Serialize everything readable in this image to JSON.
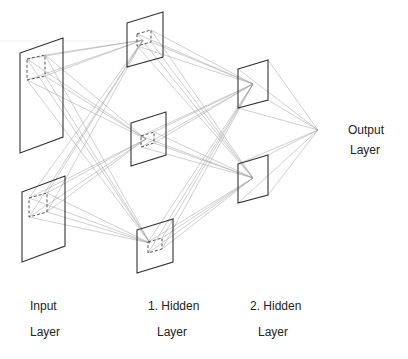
{
  "labels": {
    "input": {
      "line1": "Input",
      "line2": "Layer"
    },
    "hidden1": {
      "line1": "1. Hidden",
      "line2": "Layer"
    },
    "hidden2": {
      "line1": "2. Hidden",
      "line2": "Layer"
    },
    "output": {
      "line1": "Output",
      "line2": "Layer"
    }
  },
  "colors": {
    "plane_stroke": "#333333",
    "connection": "#9a9a9a",
    "text": "#222222",
    "background": "#ffffff"
  },
  "layers": {
    "input": [
      {
        "plane": [
          [
            20,
            53
          ],
          [
            63,
            38
          ],
          [
            63,
            137
          ],
          [
            20,
            153
          ]
        ],
        "field": [
          [
            27,
            59
          ],
          [
            45,
            55
          ],
          [
            45,
            76
          ],
          [
            27,
            80
          ]
        ]
      },
      {
        "plane": [
          [
            22,
            192
          ],
          [
            65,
            176
          ],
          [
            65,
            246
          ],
          [
            22,
            262
          ]
        ],
        "field": [
          [
            29,
            198
          ],
          [
            47,
            193
          ],
          [
            47,
            212
          ],
          [
            29,
            217
          ]
        ]
      }
    ],
    "hidden1": [
      {
        "plane": [
          [
            127,
            23
          ],
          [
            163,
            12
          ],
          [
            163,
            57
          ],
          [
            127,
            67
          ]
        ],
        "field": [
          [
            137,
            34
          ],
          [
            151,
            30
          ],
          [
            151,
            42
          ],
          [
            137,
            46
          ]
        ],
        "focus": [
          143,
          40
        ]
      },
      {
        "plane": [
          [
            131,
            123
          ],
          [
            166,
            112
          ],
          [
            166,
            155
          ],
          [
            131,
            166
          ]
        ],
        "field": [
          [
            141,
            136
          ],
          [
            154,
            132
          ],
          [
            154,
            143
          ],
          [
            141,
            147
          ]
        ],
        "focus": [
          146,
          139
        ]
      },
      {
        "plane": [
          [
            137,
            230
          ],
          [
            173,
            219
          ],
          [
            173,
            262
          ],
          [
            137,
            273
          ]
        ],
        "field": [
          [
            148,
            242
          ],
          [
            162,
            238
          ],
          [
            162,
            249
          ],
          [
            148,
            253
          ]
        ],
        "focus": [
          150,
          243
        ]
      }
    ],
    "hidden2": [
      {
        "plane": [
          [
            238,
            69
          ],
          [
            268,
            60
          ],
          [
            268,
            100
          ],
          [
            238,
            108
          ]
        ],
        "focus": [
          253,
          84
        ]
      },
      {
        "plane": [
          [
            238,
            164
          ],
          [
            268,
            155
          ],
          [
            268,
            195
          ],
          [
            238,
            203
          ]
        ],
        "focus": [
          253,
          178
        ]
      }
    ],
    "output": {
      "node": [
        318,
        130
      ]
    }
  }
}
